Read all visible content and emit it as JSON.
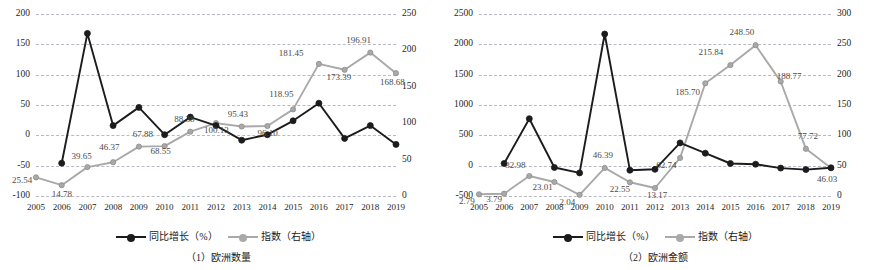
{
  "colors": {
    "growth_line": "#1c1c1c",
    "index_line": "#a9a9a9",
    "grid": "#b9b9c6",
    "axis_text": "#262626"
  },
  "legend": {
    "growth_label": "同比增长（%）",
    "index_label": "指数（右轴）"
  },
  "panels": [
    {
      "caption": "（1）欧洲数量",
      "chart_data": {
        "type": "line",
        "title": "（1）欧洲数量",
        "xlabel": "",
        "ylabel": "",
        "grid": true,
        "legend_position": "bottom",
        "categories": [
          "2005",
          "2006",
          "2007",
          "2008",
          "2009",
          "2010",
          "2011",
          "2012",
          "2013",
          "2014",
          "2015",
          "2016",
          "2017",
          "2018",
          "2019"
        ],
        "y_left": {
          "label": "同比增长（%）",
          "ticks": [
            -100,
            -50,
            0,
            50,
            100,
            150,
            200
          ],
          "tick_labels": [
            "-100",
            "-50",
            "0",
            "50",
            "100",
            "150",
            "200"
          ],
          "ylim": [
            -100,
            200
          ]
        },
        "y_right": {
          "label": "指数（右轴）",
          "ticks": [
            0,
            50,
            100,
            150,
            200,
            250
          ],
          "tick_labels": [
            "0",
            "50",
            "100",
            "150",
            "200",
            "250"
          ],
          "ylim": [
            0,
            250
          ]
        },
        "series": [
          {
            "name": "同比增长（%）",
            "axis": "left",
            "color": "#1c1c1c",
            "values": [
              null,
              -46.0,
              168.0,
              16.0,
              46.0,
              1.0,
              30.0,
              16.0,
              -8.0,
              1.0,
              24.0,
              53.0,
              -5.0,
              16.0,
              -15.0
            ],
            "labels": [
              null,
              null,
              null,
              null,
              null,
              null,
              null,
              null,
              null,
              null,
              null,
              null,
              null,
              null,
              null
            ]
          },
          {
            "name": "指数（右轴）",
            "axis": "right",
            "color": "#a9a9a9",
            "values": [
              25.54,
              14.78,
              39.65,
              46.37,
              67.88,
              68.55,
              88.38,
              100.13,
              95.43,
              96.1,
              118.95,
              181.45,
              173.39,
              196.91,
              168.68
            ],
            "labels": [
              "25.54",
              "14.78",
              "39.65",
              "46.37",
              "67.88",
              "68.55",
              "88.38",
              "100.13",
              "95.43",
              "96.10",
              "118.95",
              "181.45",
              "173.39",
              "196.91",
              "168.68"
            ]
          }
        ]
      }
    },
    {
      "caption": "（2）欧洲金额",
      "chart_data": {
        "type": "line",
        "title": "（2）欧洲金额",
        "xlabel": "",
        "ylabel": "",
        "grid": true,
        "legend_position": "bottom",
        "categories": [
          "2005",
          "2006",
          "2007",
          "2008",
          "2009",
          "2010",
          "2011",
          "2012",
          "2013",
          "2014",
          "2015",
          "2016",
          "2017",
          "2018",
          "2019"
        ],
        "y_left": {
          "label": "同比增长（%）",
          "ticks": [
            -500,
            0,
            500,
            1000,
            1500,
            2000,
            2500
          ],
          "tick_labels": [
            "-500",
            "0",
            "500",
            "1000",
            "1500",
            "2000",
            "2500"
          ],
          "ylim": [
            -500,
            2500
          ]
        },
        "y_right": {
          "label": "指数（右轴）",
          "ticks": [
            0,
            50,
            100,
            150,
            200,
            250,
            300
          ],
          "tick_labels": [
            "0",
            "50",
            "100",
            "150",
            "200",
            "250",
            "300"
          ],
          "ylim": [
            0,
            300
          ]
        },
        "series": [
          {
            "name": "同比增长（%）",
            "axis": "left",
            "color": "#1c1c1c",
            "values": [
              null,
              35.0,
              775.0,
              -30.0,
              -120.0,
              2170.0,
              -75.0,
              -60.0,
              375.0,
              205.0,
              35.0,
              25.0,
              -40.0,
              -65.0,
              -35.0
            ],
            "labels": [
              null,
              null,
              null,
              null,
              null,
              null,
              null,
              null,
              null,
              null,
              null,
              null,
              null,
              null,
              null
            ]
          },
          {
            "name": "指数（右轴）",
            "axis": "right",
            "color": "#a9a9a9",
            "values": [
              2.79,
              3.79,
              32.98,
              23.01,
              2.04,
              46.39,
              22.55,
              13.17,
              62.74,
              185.7,
              215.84,
              248.5,
              188.77,
              77.72,
              46.03
            ],
            "labels": [
              "2.79",
              "3.79",
              "32.98",
              "23.01",
              "2.04",
              "46.39",
              "22.55",
              "13.17",
              "62.74",
              "185.70",
              "215.84",
              "248.50",
              "188.77",
              "77.72",
              "46.03"
            ]
          }
        ]
      }
    }
  ]
}
